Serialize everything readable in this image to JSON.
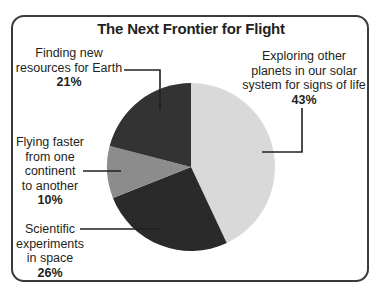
{
  "chart_data": {
    "type": "pie",
    "title": "The Next Frontier for Flight",
    "slices": [
      {
        "label": "Exploring other planets in our solar system for signs of life",
        "value": 43,
        "color": "#d9d9d9"
      },
      {
        "label": "Scientific experiments in space",
        "value": 26,
        "color": "#2a2a2a"
      },
      {
        "label": "Flying faster from one continent to another",
        "value": 10,
        "color": "#8c8c8c"
      },
      {
        "label": "Finding new resources for Earth",
        "value": 21,
        "color": "#333333"
      }
    ],
    "legend": "callout labels with leader lines"
  },
  "labels": {
    "exploring": {
      "l1": "Exploring other",
      "l2": "planets in our solar",
      "l3": "system for signs of life",
      "pct": "43%"
    },
    "scientific": {
      "l1": "Scientific",
      "l2": "experiments",
      "l3": "in space",
      "pct": "26%"
    },
    "flying": {
      "l1": "Flying faster",
      "l2": "from one",
      "l3": "continent",
      "l4": "to another",
      "pct": "10%"
    },
    "finding": {
      "l1": "Finding new",
      "l2": "resources for Earth",
      "pct": "21%"
    }
  }
}
